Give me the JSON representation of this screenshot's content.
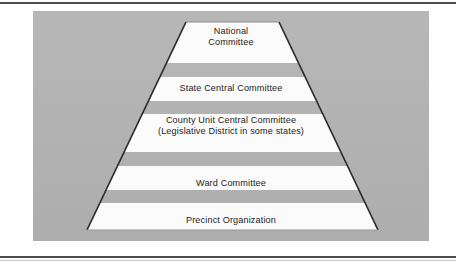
{
  "figure": {
    "type": "pyramid-hierarchy",
    "background_color": "#b3b3b3",
    "band_color": "#fbfbfb",
    "outline_color": "#2b2b2b",
    "text_color": "#232323",
    "levels": [
      {
        "id": "national",
        "rank": 1,
        "line1": "National",
        "line2": "Committee"
      },
      {
        "id": "state",
        "rank": 2,
        "line1": "State Central Committee",
        "line2": ""
      },
      {
        "id": "county",
        "rank": 3,
        "line1": "County Unit Central Committee",
        "line2": "(Legislative District in some states)"
      },
      {
        "id": "ward",
        "rank": 4,
        "line1": "Ward Committee",
        "line2": ""
      },
      {
        "id": "precinct",
        "rank": 5,
        "line1": "Precinct Organization",
        "line2": ""
      }
    ]
  }
}
